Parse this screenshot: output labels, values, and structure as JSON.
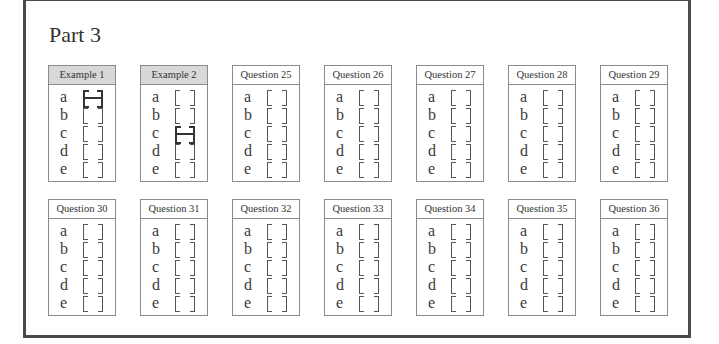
{
  "title": "Part 3",
  "options": [
    "a",
    "b",
    "c",
    "d",
    "e"
  ],
  "boxes": [
    {
      "label": "Example 1",
      "shaded": true,
      "marked": "a"
    },
    {
      "label": "Example 2",
      "shaded": true,
      "marked": "c"
    },
    {
      "label": "Question 25",
      "shaded": false,
      "marked": null
    },
    {
      "label": "Question 26",
      "shaded": false,
      "marked": null
    },
    {
      "label": "Question 27",
      "shaded": false,
      "marked": null
    },
    {
      "label": "Question 28",
      "shaded": false,
      "marked": null
    },
    {
      "label": "Question 29",
      "shaded": false,
      "marked": null
    },
    {
      "label": "Question 30",
      "shaded": false,
      "marked": null
    },
    {
      "label": "Question 31",
      "shaded": false,
      "marked": null
    },
    {
      "label": "Question 32",
      "shaded": false,
      "marked": null
    },
    {
      "label": "Question 33",
      "shaded": false,
      "marked": null
    },
    {
      "label": "Question 34",
      "shaded": false,
      "marked": null
    },
    {
      "label": "Question 35",
      "shaded": false,
      "marked": null
    },
    {
      "label": "Question 36",
      "shaded": false,
      "marked": null
    }
  ]
}
